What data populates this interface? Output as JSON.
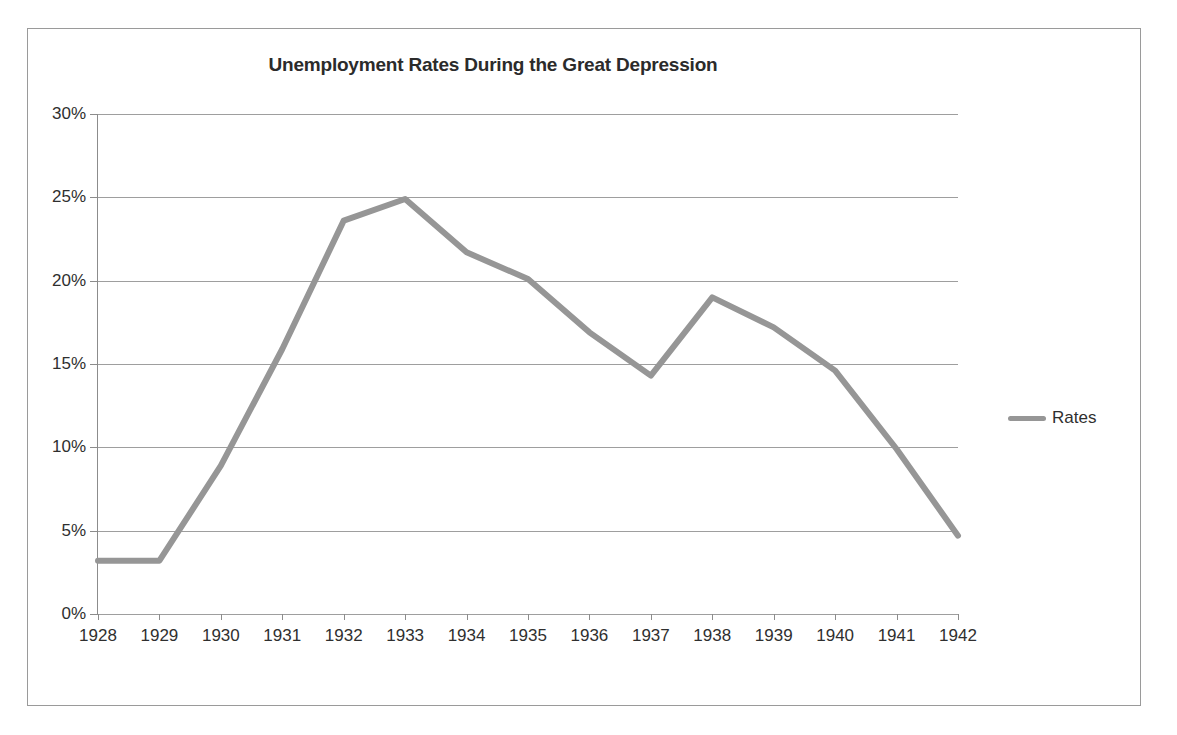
{
  "chart_data": {
    "type": "line",
    "title": "Unemployment Rates During the Great Depression",
    "xlabel": "",
    "ylabel": "",
    "categories": [
      "1928",
      "1929",
      "1930",
      "1931",
      "1932",
      "1933",
      "1934",
      "1935",
      "1936",
      "1937",
      "1938",
      "1939",
      "1940",
      "1941",
      "1942"
    ],
    "series": [
      {
        "name": "Rates",
        "color": "#969696",
        "values": [
          3.2,
          3.2,
          8.9,
          15.9,
          23.6,
          24.9,
          21.7,
          20.1,
          16.9,
          14.3,
          19.0,
          17.2,
          14.6,
          9.9,
          4.7
        ]
      }
    ],
    "ylim": [
      0,
      30
    ],
    "ytick_values": [
      0,
      5,
      10,
      15,
      20,
      25,
      30
    ],
    "ytick_labels": [
      "0%",
      "5%",
      "10%",
      "15%",
      "20%",
      "25%",
      "30%"
    ],
    "grid": true,
    "legend_position": "right",
    "legend_entries": [
      "Rates"
    ]
  },
  "legend": {
    "label": "Rates"
  },
  "frame": {
    "border_color": "#9a9a9a"
  },
  "colors": {
    "series_gray": "#969696",
    "gridline": "#9e9e9e",
    "axis": "#8c8c8c",
    "text": "#2f2f2f",
    "title": "#2b2b2b"
  }
}
